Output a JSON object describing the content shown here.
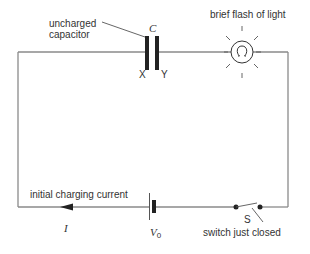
{
  "diagram": {
    "labels": {
      "capacitor_caption_line1": "uncharged",
      "capacitor_caption_line2": "capacitor",
      "capacitor_symbol": "C",
      "plate_left": "X",
      "plate_right": "Y",
      "lamp_caption": "brief flash of light",
      "current_caption": "initial charging current",
      "current_symbol": "I",
      "battery_symbol": "V",
      "battery_subscript": "0",
      "switch_symbol": "S",
      "switch_caption": "switch just closed"
    },
    "components": [
      {
        "type": "capacitor",
        "name": "C",
        "state": "uncharged"
      },
      {
        "type": "lamp",
        "state": "brief flash of light"
      },
      {
        "type": "battery",
        "name": "V0"
      },
      {
        "type": "switch",
        "name": "S",
        "state": "just closed"
      },
      {
        "type": "current-arrow",
        "name": "I",
        "direction": "left"
      }
    ],
    "colors": {
      "wire": "#8a8a8a",
      "component": "#222222",
      "text": "#333333"
    }
  }
}
